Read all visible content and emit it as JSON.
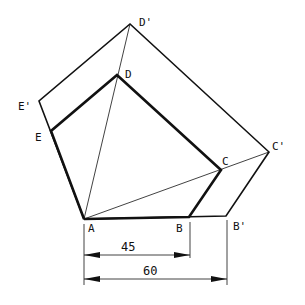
{
  "diagram": {
    "labels": {
      "A": "A",
      "B": "B",
      "B_prime": "B'",
      "C": "C",
      "C_prime": "C'",
      "D": "D",
      "D_prime": "D'",
      "E": "E",
      "E_prime": "E'"
    },
    "dimensions": {
      "AB": "45",
      "AB_prime": "60"
    },
    "colors": {
      "stroke": "#111111",
      "background": "#ffffff"
    }
  }
}
